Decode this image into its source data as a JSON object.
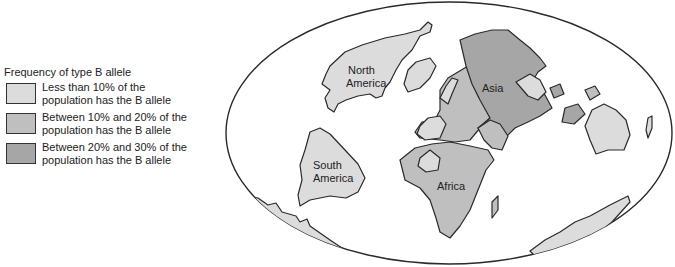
{
  "legend": {
    "title": "Frequency of type B allele",
    "items": [
      {
        "line1": "Less than 10% of the",
        "line2": "population has the B allele",
        "color": "#dcdcdc"
      },
      {
        "line1": "Between 10% and 20% of the",
        "line2": "population has the B allele",
        "color": "#bfbfbf"
      },
      {
        "line1": "Between 20% and 30% of the",
        "line2": "population has the B allele",
        "color": "#a6a6a6"
      }
    ]
  },
  "map": {
    "labels": {
      "north_america_1": "North",
      "north_america_2": "America",
      "south_america_1": "South",
      "south_america_2": "America",
      "africa": "Africa",
      "asia": "Asia"
    },
    "colors": {
      "low": "#dcdcdc",
      "mid": "#bfbfbf",
      "high": "#a6a6a6",
      "outline": "#2a2a2a",
      "ocean": "#ffffff"
    },
    "regions": [
      {
        "name": "North America",
        "category": "low"
      },
      {
        "name": "South America",
        "category": "low"
      },
      {
        "name": "Africa",
        "category": "mid"
      },
      {
        "name": "Europe",
        "category": "mid"
      },
      {
        "name": "Asia",
        "category": "high"
      },
      {
        "name": "Australia",
        "category": "low"
      },
      {
        "name": "Antarctica",
        "category": "low"
      }
    ]
  }
}
